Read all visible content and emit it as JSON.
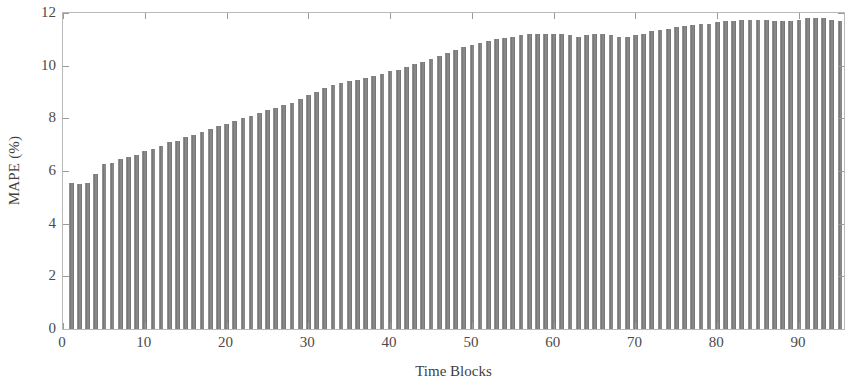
{
  "chart_data": {
    "type": "bar",
    "title": "",
    "xlabel": "Time Blocks",
    "ylabel": "MAPE (%)",
    "xlim": [
      0,
      95.5
    ],
    "ylim": [
      0,
      12
    ],
    "grid": false,
    "legend": null,
    "bar_color": "#7d7d7d",
    "frame_color": "#b9b9b9",
    "xticks": [
      0,
      10,
      20,
      30,
      40,
      50,
      60,
      70,
      80,
      90
    ],
    "xtick_labels": [
      "0",
      "10",
      "20",
      "30",
      "40",
      "50",
      "60",
      "70",
      "80",
      "90"
    ],
    "yticks": [
      0,
      2,
      4,
      6,
      8,
      10,
      12
    ],
    "ytick_labels": [
      "0",
      "2",
      "4",
      "6",
      "8",
      "10",
      "12"
    ],
    "categories": [
      1,
      2,
      3,
      4,
      5,
      6,
      7,
      8,
      9,
      10,
      11,
      12,
      13,
      14,
      15,
      16,
      17,
      18,
      19,
      20,
      21,
      22,
      23,
      24,
      25,
      26,
      27,
      28,
      29,
      30,
      31,
      32,
      33,
      34,
      35,
      36,
      37,
      38,
      39,
      40,
      41,
      42,
      43,
      44,
      45,
      46,
      47,
      48,
      49,
      50,
      51,
      52,
      53,
      54,
      55,
      56,
      57,
      58,
      59,
      60,
      61,
      62,
      63,
      64,
      65,
      66,
      67,
      68,
      69,
      70,
      71,
      72,
      73,
      74,
      75,
      76,
      77,
      78,
      79,
      80,
      81,
      82,
      83,
      84,
      85,
      86,
      87,
      88,
      89,
      90,
      91,
      92,
      93,
      94,
      95
    ],
    "values": [
      5.55,
      5.52,
      5.55,
      5.9,
      6.25,
      6.3,
      6.45,
      6.55,
      6.6,
      6.75,
      6.85,
      6.95,
      7.1,
      7.15,
      7.3,
      7.35,
      7.5,
      7.6,
      7.7,
      7.8,
      7.9,
      8.0,
      8.1,
      8.2,
      8.3,
      8.4,
      8.5,
      8.6,
      8.75,
      8.9,
      9.0,
      9.15,
      9.25,
      9.35,
      9.4,
      9.45,
      9.55,
      9.6,
      9.7,
      9.8,
      9.85,
      9.95,
      10.05,
      10.15,
      10.25,
      10.35,
      10.5,
      10.6,
      10.7,
      10.8,
      10.85,
      10.95,
      11.0,
      11.05,
      11.1,
      11.15,
      11.2,
      11.2,
      11.2,
      11.2,
      11.2,
      11.15,
      11.1,
      11.15,
      11.2,
      11.2,
      11.15,
      11.1,
      11.1,
      11.15,
      11.2,
      11.3,
      11.35,
      11.4,
      11.45,
      11.5,
      11.55,
      11.6,
      11.6,
      11.65,
      11.7,
      11.7,
      11.75,
      11.75,
      11.75,
      11.75,
      11.7,
      11.7,
      11.7,
      11.75,
      11.8,
      11.8,
      11.8,
      11.75,
      11.7
    ]
  }
}
